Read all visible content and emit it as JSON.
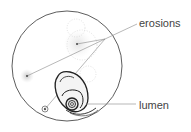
{
  "figure": {
    "labels": {
      "erosions": "erosions",
      "lumen": "lumen"
    },
    "colors": {
      "outline": "#333333",
      "leader_line": "#888888",
      "stipple": "#bbbbbb",
      "text": "#444444"
    }
  }
}
